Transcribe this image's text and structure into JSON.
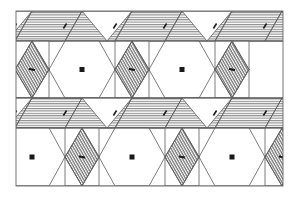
{
  "figure": {
    "type": "tessellation-pattern",
    "colors": {
      "background": "#ffffff",
      "line": "#5a5a5a",
      "hatch": "#6e6e6e",
      "motif": "#1a1a1a"
    },
    "frame": {
      "x": 16,
      "y": 11,
      "width": 267,
      "height": 175
    },
    "rows": [
      {
        "name": "band-row-1",
        "y_top": 11,
        "y_bottom": 41,
        "kind": "hatched-trapezoid-band"
      },
      {
        "name": "hexagon-row-1",
        "y_top": 41,
        "y_bottom": 98,
        "kind": "hexagons-and-rhombi",
        "hexagon_centers_x": [
          82,
          182
        ],
        "rhombus_centers_x": [
          32,
          132,
          232
        ]
      },
      {
        "name": "band-row-2",
        "y_top": 98,
        "y_bottom": 128,
        "kind": "hatched-trapezoid-band"
      },
      {
        "name": "hexagon-row-2",
        "y_top": 128,
        "y_bottom": 186,
        "kind": "hexagons-and-rhombi",
        "hexagon_centers_x": [
          32,
          132,
          232
        ],
        "rhombus_centers_x": [
          82,
          182,
          282
        ]
      }
    ]
  }
}
